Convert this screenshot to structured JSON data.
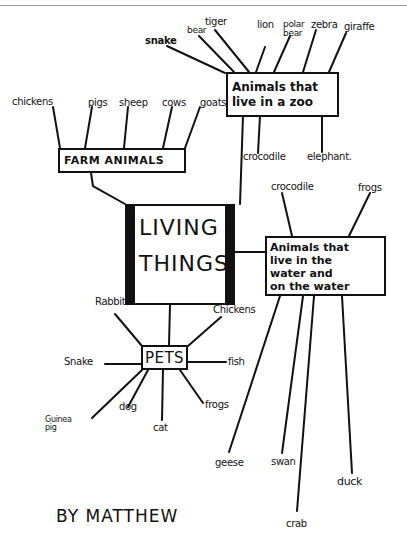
{
  "central_node": {
    "line1": "LIVING",
    "line2": "THINGS"
  },
  "branches": {
    "zoo": {
      "label_line1": "Animals that",
      "label_line2": "live in a zoo",
      "children": [
        "snake",
        "bear",
        "tiger",
        "lion",
        "polar bear",
        "zebra",
        "giraffe",
        "crocodile",
        "elephant."
      ]
    },
    "farm": {
      "label": "FARM ANIMALS",
      "children": [
        "chickens",
        "pigs",
        "sheep",
        "cows",
        "goats"
      ]
    },
    "water": {
      "label": "Animals that\nlive in the\nwater and\non the water",
      "children": [
        "crocodile",
        "frogs",
        "geese",
        "swan",
        "crab",
        "duck"
      ]
    },
    "pets": {
      "label": "PETS",
      "children": [
        "Rabbits",
        "Chickens",
        "Snake",
        "fish",
        "Guinea",
        "pig",
        "dog",
        "cat",
        "frogs"
      ]
    }
  },
  "signature": "BY MATTHEW",
  "colors": {
    "ink": "#111111",
    "paper": "#ffffff",
    "border_line": "#9a9a9a"
  }
}
